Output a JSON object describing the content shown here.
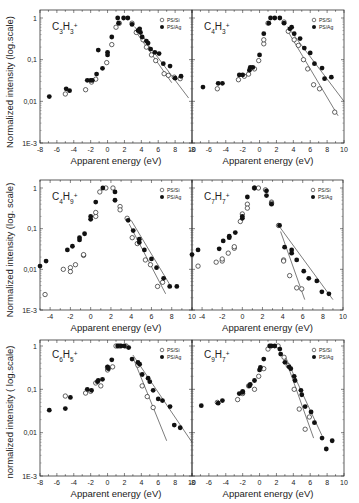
{
  "figure": {
    "y_axis_label_top": "Normalized intensity (log.scale)",
    "y_axis_label_mid": "Normalized intensity (log. scale)",
    "y_axis_label_bottom": "normalized intensity ( log.scale)",
    "x_axis_label": "Apparent energy (eV)",
    "legend": [
      {
        "marker": "open-circle",
        "label": "PS/Si"
      },
      {
        "marker": "filled-circle",
        "label": "PS/Ag"
      }
    ]
  },
  "chart_data": [
    {
      "type": "scatter",
      "panel": "top-left",
      "title": "C3H3+",
      "ion": {
        "C": "3",
        "H": "3"
      },
      "xlabel": "Apparent energy (eV)",
      "ylabel": "Normalized intensity (log.scale)",
      "xlim": [
        -8,
        10
      ],
      "ylim": [
        0.001,
        1.5
      ],
      "yscale": "log",
      "xticks": [
        -8,
        -6,
        -4,
        -2,
        0,
        2,
        4,
        6,
        8,
        10
      ],
      "xtick_labels": [
        "-8",
        "-6",
        "-4",
        "-2",
        "0",
        "2",
        "4",
        "6",
        "8",
        "10"
      ],
      "yticks": [
        0.001,
        0.01,
        0.1,
        1
      ],
      "ytick_labels": [
        "1E-3",
        "0,01",
        "0,1",
        "1"
      ],
      "legend_position": "upper right",
      "series": [
        {
          "name": "PS/Si",
          "marker": "open",
          "x": [
            -5.0,
            -2.6,
            -1.9,
            -1.4,
            -0.1,
            0.5,
            1.0,
            1.4,
            2.9,
            3.4,
            3.7,
            4.2,
            4.6,
            5.2,
            5.7,
            6.7,
            7.2,
            7.9,
            8.6
          ],
          "y": [
            0.015,
            0.019,
            0.029,
            0.034,
            0.085,
            0.23,
            0.6,
            0.75,
            0.75,
            0.45,
            0.5,
            0.3,
            0.2,
            0.13,
            0.095,
            0.046,
            0.042,
            0.038,
            0.035
          ]
        },
        {
          "name": "PS/Ag",
          "marker": "filled",
          "x": [
            -6.9,
            -4.9,
            -4.5,
            -2.4,
            -2.0,
            -1.8,
            -1.3,
            -1.1,
            -0.6,
            0.0,
            0.0,
            0.5,
            1.2,
            1.3,
            1.9,
            2.4,
            2.9,
            3.6,
            3.8,
            3.9,
            4.1,
            4.6,
            4.8,
            5.1,
            5.6,
            6.1,
            6.6,
            7.4,
            8.0,
            8.7
          ],
          "y": [
            0.013,
            0.02,
            0.018,
            0.032,
            0.032,
            0.032,
            0.045,
            0.17,
            0.062,
            0.15,
            0.13,
            0.35,
            1.0,
            0.75,
            1.0,
            1.0,
            0.7,
            0.5,
            0.55,
            0.45,
            0.35,
            0.28,
            0.25,
            0.18,
            0.15,
            0.14,
            0.08,
            0.07,
            0.036,
            0.04
          ]
        }
      ],
      "fit_lines": [
        {
          "series": "PS/Si",
          "x": [
            3.2,
            7.6
          ],
          "y": [
            0.52,
            0.028
          ]
        },
        {
          "series": "PS/Ag",
          "x": [
            3.2,
            9.6
          ],
          "y": [
            0.62,
            0.012
          ]
        }
      ]
    },
    {
      "type": "scatter",
      "panel": "top-right",
      "title": "C4H3+",
      "ion": {
        "C": "4",
        "H": "3"
      },
      "xlabel": "Apparent energy (eV)",
      "ylabel": "",
      "xlim": [
        -8,
        10
      ],
      "ylim": [
        0.001,
        1.5
      ],
      "yscale": "log",
      "xticks": [
        -8,
        -6,
        -4,
        -2,
        0,
        2,
        4,
        6,
        8,
        10
      ],
      "xtick_labels": [
        "-8",
        "-6",
        "-4",
        "-2",
        "0",
        "2",
        "4",
        "6",
        "8",
        "10"
      ],
      "yticks": [
        0.001,
        0.01,
        0.1,
        1
      ],
      "ytick_labels": [
        "",
        "",
        "",
        ""
      ],
      "legend_position": "upper right",
      "series": [
        {
          "name": "PS/Si",
          "marker": "open",
          "x": [
            -5.0,
            -2.5,
            -1.8,
            -1.3,
            -0.6,
            -0.1,
            0.5,
            0.5,
            1.0,
            2.9,
            3.4,
            4.1,
            4.6,
            5.2,
            5.7,
            6.4,
            7.1,
            8.9
          ],
          "y": [
            0.02,
            0.033,
            0.04,
            0.045,
            0.06,
            0.095,
            0.24,
            0.3,
            0.75,
            0.8,
            0.48,
            0.3,
            0.22,
            0.1,
            0.06,
            0.025,
            0.02,
            0.0055
          ]
        },
        {
          "name": "PS/Ag",
          "marker": "filled",
          "x": [
            -6.7,
            -4.9,
            -4.4,
            -2.4,
            -2.0,
            -1.1,
            -0.8,
            -1.2,
            0.0,
            0.5,
            1.1,
            1.3,
            1.8,
            2.4,
            2.9,
            3.6,
            3.8,
            4.1,
            4.8,
            5.3,
            6.0,
            6.5,
            7.4,
            7.7,
            8.5
          ],
          "y": [
            0.022,
            0.027,
            0.027,
            0.043,
            0.043,
            0.065,
            0.065,
            0.056,
            0.13,
            0.42,
            0.75,
            1.0,
            1.0,
            1.0,
            0.75,
            0.55,
            0.6,
            0.42,
            0.32,
            0.19,
            0.145,
            0.08,
            0.063,
            0.035,
            0.038
          ]
        }
      ],
      "fit_lines": [
        {
          "series": "PS/Si",
          "x": [
            3.3,
            9.3
          ],
          "y": [
            0.5,
            0.0045
          ]
        },
        {
          "series": "PS/Ag",
          "x": [
            3.3,
            10.0
          ],
          "y": [
            0.62,
            0.01
          ]
        }
      ]
    },
    {
      "type": "scatter",
      "panel": "middle-left",
      "title": "C4H9+",
      "ion": {
        "C": "4",
        "H": "9"
      },
      "xlabel": "Apparent energy (eV)",
      "ylabel": "Normalized intensity (log. scale)",
      "xlim": [
        -5,
        10
      ],
      "ylim": [
        0.001,
        1.5
      ],
      "yscale": "log",
      "xticks": [
        -4,
        -2,
        0,
        2,
        4,
        6,
        8,
        10
      ],
      "xtick_labels": [
        "-4",
        "-2",
        "0",
        "2",
        "4",
        "6",
        "8",
        "10"
      ],
      "yticks": [
        0.001,
        0.01,
        0.1,
        1
      ],
      "ytick_labels": [
        "1E-3",
        "0,01",
        "0,1",
        "1"
      ],
      "legend_position": "upper right",
      "series": [
        {
          "name": "PS/Si",
          "marker": "open",
          "x": [
            -4.5,
            -2.7,
            -2.0,
            -2.0,
            -1.5,
            -0.7,
            -0.7,
            0.5,
            0.5,
            0.9,
            1.5,
            2.2,
            2.9,
            2.9,
            3.6,
            4.1,
            4.6,
            5.4,
            5.9,
            6.6,
            7.1
          ],
          "y": [
            0.0024,
            0.01,
            0.011,
            0.0088,
            0.013,
            0.022,
            0.023,
            0.2,
            0.25,
            0.8,
            1.0,
            1.0,
            0.35,
            0.29,
            0.18,
            0.06,
            0.043,
            0.017,
            0.013,
            0.0038,
            0.0048
          ]
        },
        {
          "name": "PS/Ag",
          "marker": "filled",
          "x": [
            -5.0,
            -4.4,
            -2.3,
            -1.8,
            -1.1,
            -1.1,
            -0.6,
            0.0,
            0.0,
            0.5,
            1.2,
            2.4,
            2.4,
            3.7,
            4.2,
            4.8,
            4.8,
            5.3,
            6.0,
            6.5,
            7.2,
            7.8,
            8.5
          ],
          "y": [
            0.012,
            0.016,
            0.03,
            0.037,
            0.06,
            0.053,
            0.075,
            0.2,
            0.17,
            0.45,
            1.0,
            0.8,
            0.5,
            0.16,
            0.09,
            0.055,
            0.046,
            0.03,
            0.018,
            0.011,
            0.006,
            0.0038,
            0.0038
          ]
        }
      ],
      "fit_lines": [
        {
          "series": "PS/Si",
          "x": [
            3.8,
            7.4
          ],
          "y": [
            0.13,
            0.0025
          ]
        },
        {
          "series": "PS/Ag",
          "x": [
            4.0,
            8.0
          ],
          "y": [
            0.16,
            0.0035
          ]
        }
      ]
    },
    {
      "type": "scatter",
      "panel": "middle-right",
      "title": "C7H7+",
      "ion": {
        "C": "7",
        "H": "7"
      },
      "xlabel": "Apparent energy (eV)",
      "ylabel": "",
      "xlim": [
        -5,
        10
      ],
      "ylim": [
        0.001,
        1.5
      ],
      "yscale": "log",
      "xticks": [
        -4,
        -2,
        0,
        2,
        4,
        6,
        8,
        10
      ],
      "xtick_labels": [
        "-4",
        "-2",
        "0",
        "2",
        "4",
        "6",
        "8",
        "10"
      ],
      "yticks": [
        0.001,
        0.01,
        0.1,
        1
      ],
      "ytick_labels": [
        "",
        "",
        "",
        ""
      ],
      "legend_position": "upper right",
      "series": [
        {
          "name": "PS/Si",
          "marker": "open",
          "x": [
            -4.4,
            -2.6,
            -2.0,
            -2.0,
            -1.4,
            -0.8,
            -0.8,
            -0.2,
            0.0,
            0.5,
            0.5,
            1.2,
            1.6,
            2.3,
            2.9,
            2.9,
            3.6,
            4.1,
            4.1,
            4.7,
            5.4,
            5.9
          ],
          "y": [
            0.012,
            0.015,
            0.016,
            0.018,
            0.025,
            0.033,
            0.036,
            0.15,
            0.23,
            0.4,
            0.32,
            1.0,
            1.0,
            0.9,
            0.45,
            0.42,
            0.12,
            0.017,
            0.016,
            0.007,
            0.0035,
            0.0033
          ]
        },
        {
          "name": "PS/Ag",
          "marker": "filled",
          "x": [
            -5.0,
            -4.4,
            -2.3,
            -1.9,
            -1.3,
            -1.3,
            -0.7,
            0.0,
            0.0,
            0.5,
            1.2,
            2.4,
            2.4,
            2.9,
            3.7,
            4.2,
            4.9,
            4.9,
            5.4,
            6.1,
            6.6,
            7.4,
            7.9,
            8.6
          ],
          "y": [
            0.023,
            0.03,
            0.032,
            0.05,
            0.06,
            0.065,
            0.08,
            0.2,
            0.18,
            0.6,
            1.0,
            0.85,
            0.65,
            0.4,
            0.12,
            0.035,
            0.025,
            0.03,
            0.017,
            0.009,
            0.006,
            0.0052,
            0.0028,
            0.0025
          ]
        }
      ],
      "fit_lines": [
        {
          "series": "PS/Si",
          "x": [
            3.8,
            6.2
          ],
          "y": [
            0.085,
            0.0018
          ]
        },
        {
          "series": "PS/Ag",
          "x": [
            3.6,
            9.0
          ],
          "y": [
            0.12,
            0.0018
          ]
        }
      ]
    },
    {
      "type": "scatter",
      "panel": "bottom-left",
      "title": "C6H5+",
      "ion": {
        "C": "6",
        "H": "5"
      },
      "xlabel": "Apparent energy (eV)",
      "ylabel": "normalized intensity ( log.scale)",
      "xlim": [
        -8,
        10
      ],
      "ylim": [
        0.001,
        1.5
      ],
      "yscale": "log",
      "xticks": [
        -8,
        -6,
        -4,
        -2,
        0,
        2,
        4,
        6,
        8,
        10
      ],
      "xtick_labels": [
        "-8",
        "-6",
        "-4",
        "-2",
        "0",
        "2",
        "4",
        "6",
        "8",
        "10"
      ],
      "yticks": [
        0.001,
        0.01,
        0.1,
        1
      ],
      "ytick_labels": [
        "1E-3",
        "0,01",
        "0,1",
        "1"
      ],
      "legend_position": "upper right",
      "series": [
        {
          "name": "PS/Si",
          "marker": "open",
          "x": [
            -5.0,
            -2.6,
            -2.0,
            -1.4,
            -0.8,
            0.0,
            0.0,
            0.6,
            1.0,
            1.4,
            2.2,
            3.6,
            4.1,
            4.7,
            5.4
          ],
          "y": [
            0.07,
            0.082,
            0.09,
            0.14,
            0.12,
            0.28,
            0.32,
            0.33,
            1.0,
            1.0,
            1.0,
            0.36,
            0.12,
            0.068,
            0.038
          ]
        },
        {
          "name": "PS/Ag",
          "marker": "filled",
          "x": [
            -6.9,
            -5.0,
            -4.4,
            -2.4,
            -1.9,
            -1.2,
            -1.1,
            -0.6,
            0.0,
            0.1,
            0.5,
            1.2,
            1.6,
            2.0,
            2.5,
            2.9,
            3.6,
            3.8,
            4.1,
            4.8,
            5.0,
            5.4,
            6.0,
            6.5,
            7.4,
            7.9,
            8.6
          ],
          "y": [
            0.033,
            0.036,
            0.065,
            0.1,
            0.095,
            0.15,
            0.16,
            0.17,
            0.33,
            0.3,
            0.48,
            1.0,
            1.0,
            1.0,
            0.92,
            0.5,
            0.42,
            0.38,
            0.22,
            0.18,
            0.15,
            0.095,
            0.06,
            0.055,
            0.04,
            0.015,
            0.013
          ]
        }
      ],
      "fit_lines": [
        {
          "series": "PS/Si",
          "x": [
            3.0,
            7.0
          ],
          "y": [
            0.55,
            0.0065
          ]
        },
        {
          "series": "PS/Ag",
          "x": [
            3.0,
            10.0
          ],
          "y": [
            0.62,
            0.006
          ]
        }
      ]
    },
    {
      "type": "scatter",
      "panel": "bottom-right",
      "title": "C9H7+",
      "ion": {
        "C": "9",
        "H": "7"
      },
      "xlabel": "Apparent energy (eV)",
      "ylabel": "",
      "xlim": [
        -8,
        10
      ],
      "ylim": [
        0.001,
        1.5
      ],
      "yscale": "log",
      "xticks": [
        -8,
        -6,
        -4,
        -2,
        0,
        2,
        4,
        6,
        8,
        10
      ],
      "xtick_labels": [
        "-8",
        "-6",
        "-4",
        "-2",
        "0",
        "2",
        "4",
        "6",
        "8",
        "10"
      ],
      "yticks": [
        0.001,
        0.01,
        0.1,
        1
      ],
      "ytick_labels": [
        "",
        "",
        "",
        ""
      ],
      "legend_position": "upper right",
      "series": [
        {
          "name": "PS/Si",
          "marker": "open",
          "x": [
            -5.0,
            -2.6,
            -2.0,
            -1.3,
            -0.6,
            -0.1,
            0.5,
            1.0,
            2.2,
            2.9,
            3.4,
            4.1,
            4.7,
            5.4,
            5.9
          ],
          "y": [
            0.05,
            0.058,
            0.08,
            0.12,
            0.1,
            0.2,
            0.3,
            0.85,
            1.0,
            0.55,
            0.35,
            0.1,
            0.035,
            0.012,
            0.023
          ]
        },
        {
          "name": "PS/Ag",
          "marker": "filled",
          "x": [
            -6.9,
            -4.9,
            -4.4,
            -2.4,
            -2.0,
            -2.0,
            -1.2,
            -1.1,
            -0.6,
            0.0,
            0.1,
            0.5,
            1.2,
            1.4,
            1.8,
            2.4,
            2.5,
            3.0,
            3.5,
            3.7,
            4.1,
            4.2,
            4.9,
            5.0,
            5.4,
            6.1,
            6.5,
            7.4,
            7.9,
            8.6
          ],
          "y": [
            0.042,
            0.048,
            0.055,
            0.08,
            0.09,
            0.085,
            0.12,
            0.13,
            0.16,
            0.28,
            0.32,
            0.5,
            1.0,
            1.0,
            1.0,
            0.85,
            0.65,
            0.42,
            0.33,
            0.3,
            0.2,
            0.16,
            0.095,
            0.075,
            0.04,
            0.03,
            0.017,
            0.0075,
            0.0042,
            0.0065
          ]
        }
      ],
      "fit_lines": [
        {
          "series": "PS/Si",
          "x": [
            3.0,
            6.4
          ],
          "y": [
            0.55,
            0.0075
          ]
        },
        {
          "series": "PS/Ag",
          "x": [
            3.0,
            7.4
          ],
          "y": [
            0.6,
            0.0085
          ]
        }
      ]
    }
  ]
}
